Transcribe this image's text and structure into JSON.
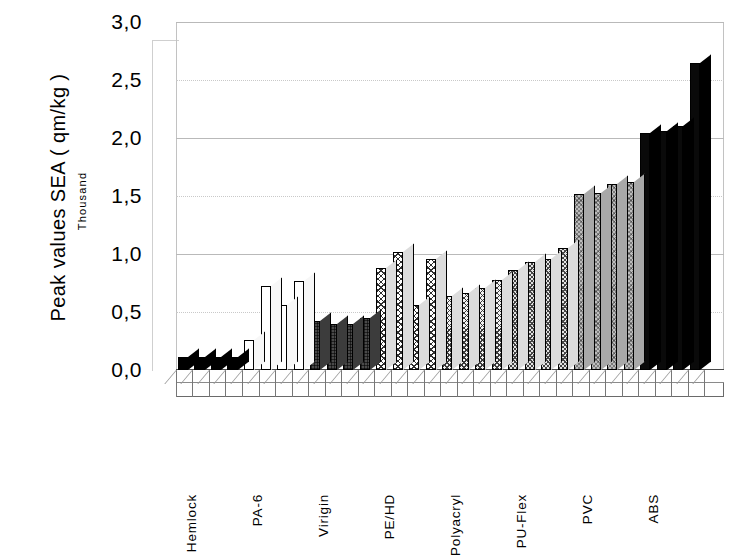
{
  "chart_data": {
    "type": "bar",
    "title": "",
    "ylabel": "Peak values  SEA  ( qm/kg )",
    "ylabel_unit": "Thousand",
    "xlabel": "",
    "ylim": [
      0,
      3.0
    ],
    "ytick_labels": [
      "0,0",
      "0,5",
      "1,0",
      "1,5",
      "2,0",
      "2,5",
      "3,0"
    ],
    "ytick_values": [
      0,
      0.5,
      1.0,
      1.5,
      2.0,
      2.5,
      3.0
    ],
    "grid": true,
    "legend": "none",
    "categories": [
      "Hemlock",
      "PA-6",
      "Virigin",
      "PE/HD",
      "Polyacryl",
      "PU-Flex",
      "PVC",
      "ABS"
    ],
    "bars": [
      {
        "value": 0.11,
        "fill": "solid",
        "group": "Hemlock"
      },
      {
        "value": 0.11,
        "fill": "solid",
        "group": "Hemlock"
      },
      {
        "value": 0.11,
        "fill": "solid",
        "group": "Hemlock"
      },
      {
        "value": 0.11,
        "fill": "solid",
        "group": "Hemlock"
      },
      {
        "value": 0.26,
        "fill": "white",
        "group": "PA-6"
      },
      {
        "value": 0.72,
        "fill": "white",
        "group": "PA-6"
      },
      {
        "value": 0.56,
        "fill": "white",
        "group": "PA-6"
      },
      {
        "value": 0.77,
        "fill": "white",
        "group": "PA-6"
      },
      {
        "value": 0.42,
        "fill": "dark",
        "group": "Virigin"
      },
      {
        "value": 0.4,
        "fill": "dark",
        "group": "Virigin"
      },
      {
        "value": 0.4,
        "fill": "dark",
        "group": "Virigin"
      },
      {
        "value": 0.45,
        "fill": "dark",
        "group": "Virigin"
      },
      {
        "value": 0.88,
        "fill": "hatch-light",
        "group": "PE/HD"
      },
      {
        "value": 1.02,
        "fill": "hatch-light",
        "group": "PE/HD"
      },
      {
        "value": 0.56,
        "fill": "hatch-light",
        "group": "PE/HD"
      },
      {
        "value": 0.96,
        "fill": "hatch-light",
        "group": "PE/HD"
      },
      {
        "value": 0.64,
        "fill": "hatch-mid",
        "group": "Polyacryl"
      },
      {
        "value": 0.66,
        "fill": "hatch-mid",
        "group": "Polyacryl"
      },
      {
        "value": 0.71,
        "fill": "hatch-mid",
        "group": "Polyacryl"
      },
      {
        "value": 0.78,
        "fill": "hatch-mid",
        "group": "Polyacryl"
      },
      {
        "value": 0.86,
        "fill": "hatch-grey",
        "group": "PU-Flex"
      },
      {
        "value": 0.93,
        "fill": "hatch-grey",
        "group": "PU-Flex"
      },
      {
        "value": 0.96,
        "fill": "hatch-grey",
        "group": "PU-Flex"
      },
      {
        "value": 1.05,
        "fill": "hatch-grey",
        "group": "PU-Flex"
      },
      {
        "value": 1.52,
        "fill": "grey",
        "group": "PVC"
      },
      {
        "value": 1.53,
        "fill": "grey",
        "group": "PVC"
      },
      {
        "value": 1.6,
        "fill": "grey",
        "group": "PVC"
      },
      {
        "value": 1.62,
        "fill": "grey",
        "group": "PVC"
      },
      {
        "value": 2.04,
        "fill": "black2",
        "group": "ABS"
      },
      {
        "value": 2.06,
        "fill": "black2",
        "group": "ABS"
      },
      {
        "value": 2.1,
        "fill": "black2",
        "group": "ABS"
      },
      {
        "value": 2.65,
        "fill": "black2",
        "group": "ABS"
      }
    ]
  }
}
